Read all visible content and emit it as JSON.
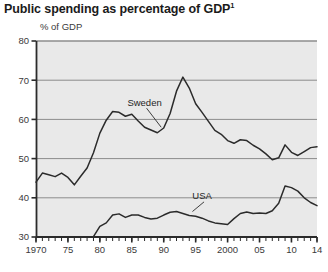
{
  "title": "Public spending as percentage of GDP",
  "title_footnote_marker": "1",
  "axis_title": "% of GDP",
  "colors": {
    "plot_background": "#e9e9e9",
    "gridline": "#8c8c8c",
    "axis": "#2b2b2b",
    "series_line": "#2b2b2b",
    "title_text": "#1b1b1b",
    "tick_text": "#3a3a3a"
  },
  "chart_data": {
    "type": "line",
    "title": "Public spending as percentage of GDP",
    "xlabel": "",
    "ylabel": "% of GDP",
    "xlim": [
      1970,
      2014
    ],
    "ylim": [
      30,
      80
    ],
    "yticks": [
      30,
      40,
      50,
      60,
      70,
      80
    ],
    "ytick_labels": [
      "30",
      "40",
      "50",
      "60",
      "70",
      "80"
    ],
    "xticks": [
      1970,
      1975,
      1980,
      1985,
      1990,
      1995,
      2000,
      2005,
      2010,
      2014
    ],
    "xtick_labels": [
      "1970",
      "75",
      "80",
      "85",
      "90",
      "95",
      "2000",
      "05",
      "10",
      "14"
    ],
    "minor_xtick_interval": 1,
    "grid": "horizontal",
    "legend": "inline-annotations",
    "series": [
      {
        "name": "Sweden",
        "label_x": 1987,
        "label_y": 63.5,
        "leader_to_x": 1989.6,
        "leader_to_y": 58.0,
        "x": [
          1970,
          1971,
          1972,
          1973,
          1974,
          1975,
          1976,
          1977,
          1978,
          1979,
          1980,
          1981,
          1982,
          1983,
          1984,
          1985,
          1986,
          1987,
          1988,
          1989,
          1990,
          1991,
          1992,
          1993,
          1994,
          1995,
          1996,
          1997,
          1998,
          1999,
          2000,
          2001,
          2002,
          2003,
          2004,
          2005,
          2006,
          2007,
          2008,
          2009,
          2010,
          2011,
          2012,
          2013,
          2014
        ],
        "values": [
          44.0,
          46.3,
          45.9,
          45.4,
          46.3,
          45.2,
          43.3,
          45.5,
          47.6,
          51.5,
          56.5,
          59.8,
          62.0,
          61.8,
          60.8,
          61.3,
          59.6,
          58.0,
          57.3,
          56.6,
          57.8,
          61.5,
          67.2,
          70.8,
          68.0,
          64.0,
          61.8,
          59.5,
          57.2,
          56.2,
          54.6,
          53.9,
          54.8,
          54.6,
          53.4,
          52.5,
          51.2,
          49.7,
          50.2,
          53.5,
          51.6,
          50.8,
          51.8,
          52.8,
          53.0
        ]
      },
      {
        "name": "USA",
        "label_x": 1996,
        "label_y": 39.6,
        "leader_to_x": 1994.5,
        "leader_to_y": 36.5,
        "x": [
          1979,
          1980,
          1981,
          1982,
          1983,
          1984,
          1985,
          1986,
          1987,
          1988,
          1989,
          1990,
          1991,
          1992,
          1993,
          1994,
          1995,
          1996,
          1997,
          1998,
          1999,
          2000,
          2001,
          2002,
          2003,
          2004,
          2005,
          2006,
          2007,
          2008,
          2009,
          2010,
          2011,
          2012,
          2013,
          2014
        ],
        "values": [
          30.1,
          32.7,
          33.6,
          35.6,
          35.9,
          35.0,
          35.6,
          35.6,
          35.0,
          34.6,
          34.8,
          35.6,
          36.3,
          36.5,
          36.0,
          35.5,
          35.3,
          34.8,
          34.1,
          33.6,
          33.4,
          33.2,
          34.7,
          36.0,
          36.4,
          36.0,
          36.1,
          36.0,
          36.7,
          38.6,
          43.0,
          42.6,
          41.7,
          40.0,
          38.8,
          38.0
        ]
      }
    ]
  },
  "footnote": ""
}
